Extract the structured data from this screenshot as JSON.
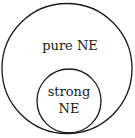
{
  "diagram": {
    "type": "venn-nested",
    "outer": {
      "label": "pure NE",
      "cx": 67,
      "cy": 68,
      "r": 65
    },
    "inner": {
      "label_line1": "strong",
      "label_line2": "NE",
      "cx": 69,
      "cy": 101,
      "r": 32
    },
    "stroke_color": "#1a1a1a",
    "background": "#ffffff"
  }
}
